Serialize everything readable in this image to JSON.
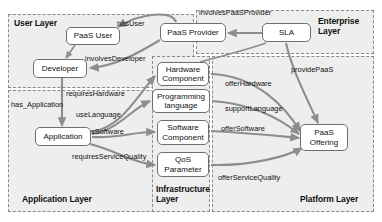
{
  "diagram": {
    "layers": [
      {
        "id": "user",
        "label": "User Layer",
        "x": 8,
        "y": 14,
        "w": 186,
        "h": 74
      },
      {
        "id": "enterprise",
        "label": "Enterprise\nLayer",
        "x": 196,
        "y": 10,
        "w": 178,
        "h": 44
      },
      {
        "id": "application",
        "label": "Application Layer",
        "x": 8,
        "y": 90,
        "w": 186,
        "h": 122
      },
      {
        "id": "infrastructure",
        "label": "Infrastructure\nLayer",
        "x": 152,
        "y": 56,
        "w": 58,
        "h": 156
      },
      {
        "id": "platform",
        "label": "Platform Layer",
        "x": 212,
        "y": 56,
        "w": 162,
        "h": 156
      }
    ],
    "layer_label_positions": [
      {
        "id": "user",
        "x": 14,
        "y": 18,
        "align": "left"
      },
      {
        "id": "enterprise",
        "x": 318,
        "y": 16,
        "align": "left"
      },
      {
        "id": "application",
        "x": 22,
        "y": 194,
        "align": "left"
      },
      {
        "id": "infrastructure",
        "x": 156,
        "y": 184,
        "align": "left"
      },
      {
        "id": "platform",
        "x": 300,
        "y": 194,
        "align": "left"
      }
    ],
    "nodes": [
      {
        "id": "paas-user",
        "label": "PaaS User",
        "x": 66,
        "y": 27,
        "w": 54,
        "h": 18
      },
      {
        "id": "paas-provider",
        "label": "PaaS Provider",
        "x": 160,
        "y": 23,
        "w": 66,
        "h": 19
      },
      {
        "id": "sla",
        "label": "SLA",
        "x": 262,
        "y": 23,
        "w": 49,
        "h": 19
      },
      {
        "id": "developer",
        "label": "Developer",
        "x": 33,
        "y": 59,
        "w": 54,
        "h": 19
      },
      {
        "id": "application",
        "label": "Application",
        "x": 35,
        "y": 127,
        "w": 56,
        "h": 19
      },
      {
        "id": "hardware-component",
        "label": "Hardware\nComponent",
        "x": 157,
        "y": 62,
        "w": 52,
        "h": 24
      },
      {
        "id": "programming-language",
        "label": "Programming\nlanguage",
        "x": 152,
        "y": 89,
        "w": 58,
        "h": 24
      },
      {
        "id": "software-component",
        "label": "Software\nComponent",
        "x": 157,
        "y": 120,
        "w": 52,
        "h": 25
      },
      {
        "id": "qos-parameter",
        "label": "QoS\nParameter",
        "x": 157,
        "y": 152,
        "w": 52,
        "h": 25
      },
      {
        "id": "paas-offering",
        "label": "PaaS\nOffering",
        "x": 300,
        "y": 124,
        "w": 48,
        "h": 27
      }
    ],
    "relations": [
      {
        "id": "has-user",
        "label": "hasUser",
        "x": 117,
        "y": 20
      },
      {
        "id": "involves-paas-provider",
        "label": "involvesPaaSProvider",
        "x": 199,
        "y": 9
      },
      {
        "id": "involves-developer",
        "label": "involvesDeveloper",
        "x": 85,
        "y": 55
      },
      {
        "id": "requires-hardware",
        "label": "requiresHardware",
        "x": 66,
        "y": 90
      },
      {
        "id": "has-application",
        "label": "has_Application",
        "x": 11,
        "y": 101
      },
      {
        "id": "use-language",
        "label": "useLanguage",
        "x": 76,
        "y": 111
      },
      {
        "id": "requires-software",
        "label": "requiresSoftware",
        "x": 68,
        "y": 128
      },
      {
        "id": "requires-service-quality",
        "label": "requiresServiceQuality",
        "x": 72,
        "y": 153
      },
      {
        "id": "offer-hardware",
        "label": "offerHardware",
        "x": 225,
        "y": 80
      },
      {
        "id": "support-language",
        "label": "supportLanguage",
        "x": 225,
        "y": 105
      },
      {
        "id": "provide-paas",
        "label": "providePaaS",
        "x": 291,
        "y": 66
      },
      {
        "id": "offer-software",
        "label": "offerSoftware",
        "x": 221,
        "y": 125
      },
      {
        "id": "offer-service-quality",
        "label": "offerServiceQuality",
        "x": 218,
        "y": 174
      }
    ],
    "colors": {
      "layer_fill": "#eeeeee",
      "layer_border": "#8a8a8a",
      "node_fill": "#ffffff",
      "node_border": "#6f6f6f",
      "edge": "#8d8d8d",
      "text": "#111111"
    }
  }
}
